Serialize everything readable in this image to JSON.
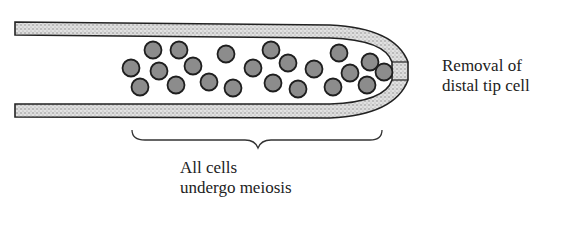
{
  "figure": {
    "type": "gonad-arm-diagram",
    "colors": {
      "background": "#ffffff",
      "outline": "#222222",
      "wall_stipple": "#bdbdbd",
      "nucleus_fill": "#8c8c8c",
      "nucleus_outline": "#1e1e1e"
    }
  },
  "annotations": {
    "removal": {
      "line1": "Removal of",
      "line2": "distal tip cell"
    },
    "meiosis": {
      "line1": "All cells",
      "line2": "undergo meiosis"
    }
  },
  "cells": [
    {
      "cx": 153,
      "cy": 50
    },
    {
      "cx": 179,
      "cy": 50
    },
    {
      "cx": 131,
      "cy": 68
    },
    {
      "cx": 159,
      "cy": 71
    },
    {
      "cx": 193,
      "cy": 66
    },
    {
      "cx": 226,
      "cy": 54
    },
    {
      "cx": 140,
      "cy": 87
    },
    {
      "cx": 176,
      "cy": 85
    },
    {
      "cx": 209,
      "cy": 82
    },
    {
      "cx": 233,
      "cy": 88
    },
    {
      "cx": 253,
      "cy": 68
    },
    {
      "cx": 271,
      "cy": 50
    },
    {
      "cx": 288,
      "cy": 63
    },
    {
      "cx": 339,
      "cy": 53
    },
    {
      "cx": 314,
      "cy": 69
    },
    {
      "cx": 273,
      "cy": 83
    },
    {
      "cx": 298,
      "cy": 89
    },
    {
      "cx": 333,
      "cy": 87
    },
    {
      "cx": 350,
      "cy": 73
    },
    {
      "cx": 370,
      "cy": 62
    },
    {
      "cx": 384,
      "cy": 72
    },
    {
      "cx": 367,
      "cy": 85
    }
  ]
}
